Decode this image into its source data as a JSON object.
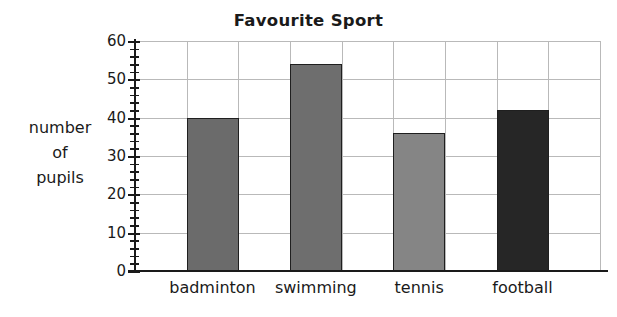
{
  "chart_data": {
    "type": "bar",
    "title": "Favourite Sport",
    "xlabel": "",
    "ylabel": "number of pupils",
    "ylabel_lines": [
      "number",
      "of",
      "pupils"
    ],
    "categories": [
      "badminton",
      "swimming",
      "tennis",
      "football"
    ],
    "values": [
      40,
      54,
      36,
      42
    ],
    "ylim": [
      0,
      60
    ],
    "ytick_major_step": 10,
    "ytick_minor_step": 2,
    "ytick_labels": [
      "0",
      "10",
      "20",
      "30",
      "40",
      "50",
      "60"
    ],
    "grid": true,
    "legend": "none",
    "bar_colors": [
      "#6b6b6b",
      "#6e6e6e",
      "#858585",
      "#262626"
    ],
    "bar_outline_color": "#1f1f1f",
    "gridline_color": "#b9b9b9",
    "axis_color": "#1a1a1a",
    "background_color": "#ffffff",
    "series": [
      {
        "name": "number of pupils",
        "points": [
          {
            "category": "badminton",
            "value": 40,
            "color": "#6b6b6b"
          },
          {
            "category": "swimming",
            "value": 54,
            "color": "#6e6e6e"
          },
          {
            "category": "tennis",
            "value": 36,
            "color": "#858585"
          },
          {
            "category": "football",
            "value": 42,
            "color": "#262626"
          }
        ]
      }
    ]
  }
}
